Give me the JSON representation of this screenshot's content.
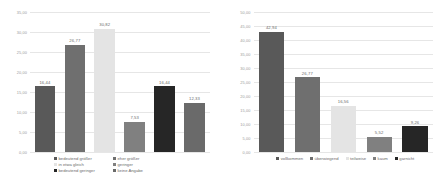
{
  "colors": {
    "series": [
      "#595959",
      "#6f6f6f",
      "#e4e4e4",
      "#808080",
      "#262626",
      "#6a6a6a"
    ],
    "gridline": "#e6e6e6",
    "axis_text": "#9a9a9a",
    "label_text": "#6b6b6b",
    "background": "#ffffff"
  },
  "chart_data": [
    {
      "type": "bar",
      "title": "",
      "xlabel": "",
      "ylabel": "",
      "ylim": [
        0,
        35
      ],
      "yticks": [
        "0,00",
        "5,00",
        "10,00",
        "15,00",
        "20,00",
        "25,00",
        "30,00",
        "35,00"
      ],
      "ytick_values": [
        0,
        5,
        10,
        15,
        20,
        25,
        30,
        35
      ],
      "grid": true,
      "legend_position": "bottom",
      "categories": [
        "bedeutend größer",
        "eher größer",
        "in etwa gleich",
        "geringer",
        "bedeutend geringer",
        "keine Angabe"
      ],
      "values": [
        16.44,
        26.77,
        30.82,
        7.53,
        16.44,
        12.33
      ],
      "data_labels": [
        "16,44",
        "26,77",
        "30,82",
        "7,53",
        "16,44",
        "12,33"
      ],
      "bar_colors": [
        "#595959",
        "#6f6f6f",
        "#e4e4e4",
        "#808080",
        "#262626",
        "#6a6a6a"
      ],
      "legend": [
        {
          "label": "bedeutend größer",
          "color": "#595959"
        },
        {
          "label": "eher größer",
          "color": "#6f6f6f"
        },
        {
          "label": "in etwa gleich",
          "color": "#e4e4e4"
        },
        {
          "label": "geringer",
          "color": "#808080"
        },
        {
          "label": "bedeutend geringer",
          "color": "#262626"
        },
        {
          "label": "keine Angabe",
          "color": "#6a6a6a"
        }
      ]
    },
    {
      "type": "bar",
      "title": "",
      "xlabel": "",
      "ylabel": "",
      "ylim": [
        0,
        50
      ],
      "yticks": [
        "0,00",
        "5,00",
        "10,00",
        "15,00",
        "20,00",
        "25,00",
        "30,00",
        "35,00",
        "40,00",
        "45,00",
        "50,00"
      ],
      "ytick_values": [
        0,
        5,
        10,
        15,
        20,
        25,
        30,
        35,
        40,
        45,
        50
      ],
      "grid": true,
      "legend_position": "bottom",
      "categories": [
        "vollkommen",
        "überwiegend",
        "teilweise",
        "kaum",
        "garnicht"
      ],
      "values": [
        42.94,
        26.77,
        16.56,
        5.52,
        9.26
      ],
      "data_labels": [
        "42,94",
        "26,77",
        "16,56",
        "5,52",
        "9,26"
      ],
      "bar_colors": [
        "#595959",
        "#6f6f6f",
        "#e4e4e4",
        "#808080",
        "#262626"
      ],
      "legend": [
        {
          "label": "vollkommen",
          "color": "#595959"
        },
        {
          "label": "überwiegend",
          "color": "#6f6f6f"
        },
        {
          "label": "teilweise",
          "color": "#e4e4e4"
        },
        {
          "label": "kaum",
          "color": "#808080"
        },
        {
          "label": "garnicht",
          "color": "#262626"
        }
      ]
    }
  ]
}
